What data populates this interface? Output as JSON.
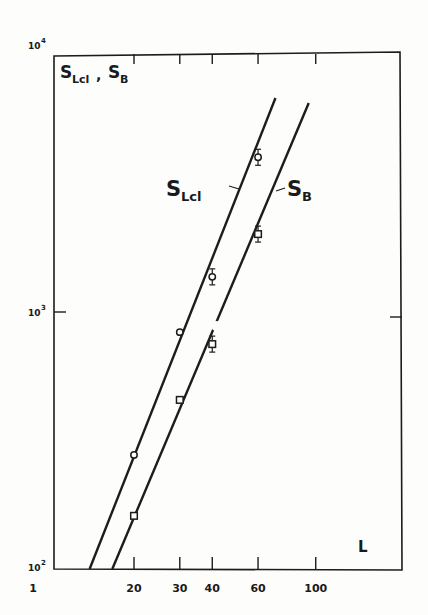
{
  "chart_data": {
    "type": "scatter",
    "title": "",
    "corner_label": {
      "main1": "S",
      "sub1": "Lcl",
      "sep": ",",
      "main2": "S",
      "sub2": "B"
    },
    "xlabel": "L",
    "ylabel": "S_Lcl , S_B",
    "xscale": "log",
    "yscale": "log",
    "xlim": [
      10,
      200
    ],
    "ylim": [
      100,
      10000
    ],
    "x_ticks": [
      20,
      30,
      40,
      60,
      100
    ],
    "x_tick_labels": [
      "1",
      "20",
      "30",
      "40",
      "60",
      "100"
    ],
    "y_ticks": [
      100,
      1000,
      10000
    ],
    "y_tick_labels": [
      {
        "base": "10",
        "exp": "2"
      },
      {
        "base": "10",
        "exp": "3"
      },
      {
        "base": "10",
        "exp": "4"
      }
    ],
    "grid": false,
    "legend": "inline",
    "series": [
      {
        "name": "S_Lcl",
        "label_main": "S",
        "label_sub": "Lcl",
        "marker": "circle",
        "x": [
          20,
          30,
          40,
          60
        ],
        "y": [
          278,
          835,
          1370,
          4000
        ],
        "error_bars": [
          false,
          false,
          true,
          true
        ],
        "fit_line": {
          "x": [
            13.5,
            70
          ],
          "y": [
            100,
            6800
          ]
        }
      },
      {
        "name": "S_B",
        "label_main": "S",
        "label_sub": "B",
        "marker": "square",
        "x": [
          20,
          30,
          40,
          60
        ],
        "y": [
          161,
          455,
          750,
          2010
        ],
        "error_bars": [
          false,
          false,
          true,
          true
        ],
        "fit_line": {
          "x": [
            16.5,
            94
          ],
          "y": [
            100,
            6500
          ]
        }
      }
    ]
  }
}
